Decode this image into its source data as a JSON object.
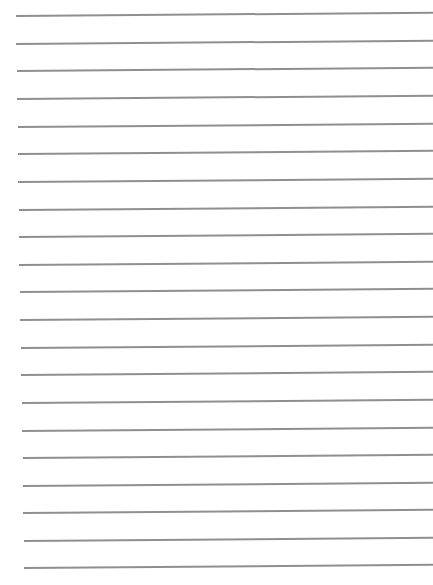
{
  "page": {
    "type": "lined-paper",
    "background_color": "#ffffff",
    "line_color": "#8f8f8f",
    "line_count": 21,
    "line_spacing_px": 27.6,
    "first_line_y": 15,
    "lines": [
      {
        "y": 15,
        "x_start": 16
      },
      {
        "y": 43,
        "x_start": 16
      },
      {
        "y": 70,
        "x_start": 17
      },
      {
        "y": 98,
        "x_start": 17
      },
      {
        "y": 126,
        "x_start": 18
      },
      {
        "y": 153,
        "x_start": 18
      },
      {
        "y": 181,
        "x_start": 18
      },
      {
        "y": 209,
        "x_start": 19
      },
      {
        "y": 236,
        "x_start": 19
      },
      {
        "y": 264,
        "x_start": 19
      },
      {
        "y": 291,
        "x_start": 20
      },
      {
        "y": 319,
        "x_start": 20
      },
      {
        "y": 347,
        "x_start": 21
      },
      {
        "y": 374,
        "x_start": 21
      },
      {
        "y": 402,
        "x_start": 22
      },
      {
        "y": 430,
        "x_start": 22
      },
      {
        "y": 457,
        "x_start": 23
      },
      {
        "y": 485,
        "x_start": 23
      },
      {
        "y": 512,
        "x_start": 23
      },
      {
        "y": 540,
        "x_start": 24
      },
      {
        "y": 567,
        "x_start": 24
      }
    ]
  }
}
